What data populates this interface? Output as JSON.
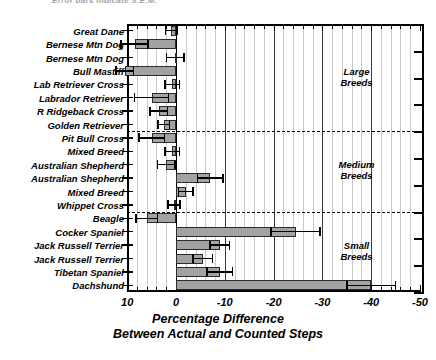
{
  "clipped_header": "Error bars indicate S.E.M.",
  "axis": {
    "x_title_line1": "Percentage Difference",
    "x_title_line2": "Between Actual and Counted Steps",
    "x_ticks": [
      10,
      0,
      -10,
      -20,
      -30,
      -40,
      -50
    ],
    "x_tick_labels": [
      "10",
      "0",
      "-10",
      "-20",
      "-30",
      "-40",
      "-50"
    ],
    "x_min_value": 10,
    "x_max_value": -50
  },
  "groups": [
    {
      "id": "large",
      "label_line1": "Large",
      "label_line2": "Breeds"
    },
    {
      "id": "medium",
      "label_line1": "Medium",
      "label_line2": "Breeds"
    },
    {
      "id": "small",
      "label_line1": "Small",
      "label_line2": "Breeds"
    }
  ],
  "chart_data": {
    "type": "bar",
    "orientation": "horizontal",
    "title": "",
    "xlabel": "Percentage Difference Between Actual and Counted Steps",
    "ylabel": "",
    "xlim": [
      10,
      -50
    ],
    "x_reversed": true,
    "grid": true,
    "legend": null,
    "error_bar_type": "S.E.M.",
    "categories": [
      "Great Dane",
      "Bernese Mtn Dog",
      "Bernese Mtn Dog",
      "Bull Mastiff",
      "Lab Retriever Cross",
      "Labrador Retriever",
      "R Ridgeback Cross",
      "Golden Retriever",
      "Pit Bull Cross",
      "Mixed Breed",
      "Australian Shepherd",
      "Australian Shepherd",
      "Mixed Breed",
      "Whippet Cross",
      "Beagle",
      "Cocker Spaniel",
      "Jack Russell Terrier",
      "Jack Russell Terrier",
      "Tibetan Spaniel",
      "Dachshund"
    ],
    "values": [
      1.0,
      8.5,
      0.2,
      10.5,
      0.8,
      5.0,
      3.5,
      2.5,
      5.0,
      0.8,
      2.0,
      -7.0,
      -2.0,
      0.4,
      6.0,
      -24.5,
      -9.0,
      -5.5,
      -9.0,
      -40.0
    ],
    "errors": [
      1.2,
      2.8,
      1.8,
      1.8,
      1.5,
      3.5,
      1.8,
      1.2,
      2.6,
      1.5,
      1.8,
      2.6,
      1.5,
      1.2,
      2.2,
      5.0,
      2.0,
      2.0,
      2.6,
      5.0
    ],
    "group_of": [
      "large",
      "large",
      "large",
      "large",
      "large",
      "large",
      "large",
      "large",
      "medium",
      "medium",
      "medium",
      "medium",
      "medium",
      "medium",
      "small",
      "small",
      "small",
      "small",
      "small",
      "small"
    ]
  }
}
